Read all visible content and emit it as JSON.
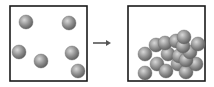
{
  "diagram": {
    "colors": {
      "box_stroke": "#1a1a1a",
      "arrow": "#555555",
      "sphere_light": "#d8d8d8",
      "sphere_mid": "#8f8f8f",
      "sphere_dark": "#5a5a5a"
    },
    "left_box": {
      "label": "",
      "x": 10,
      "y": 6,
      "w": 77,
      "h": 75,
      "particles": [
        {
          "cx": 26,
          "cy": 22
        },
        {
          "cx": 69,
          "cy": 23
        },
        {
          "cx": 19,
          "cy": 52
        },
        {
          "cx": 41,
          "cy": 61
        },
        {
          "cx": 72,
          "cy": 53
        },
        {
          "cx": 78,
          "cy": 71
        }
      ]
    },
    "arrow": {
      "x1": 93,
      "y1": 43,
      "x2": 111,
      "y2": 43,
      "direction": "right"
    },
    "right_box": {
      "label": "",
      "x": 128,
      "y": 6,
      "w": 77,
      "h": 75,
      "particles": [
        {
          "cx": 145,
          "cy": 73
        },
        {
          "cx": 157,
          "cy": 64
        },
        {
          "cx": 156,
          "cy": 45
        },
        {
          "cx": 145,
          "cy": 54
        },
        {
          "cx": 166,
          "cy": 71
        },
        {
          "cx": 178,
          "cy": 64
        },
        {
          "cx": 186,
          "cy": 72
        },
        {
          "cx": 196,
          "cy": 64
        },
        {
          "cx": 168,
          "cy": 54
        },
        {
          "cx": 179,
          "cy": 56
        },
        {
          "cx": 186,
          "cy": 60
        },
        {
          "cx": 190,
          "cy": 52
        },
        {
          "cx": 165,
          "cy": 43
        },
        {
          "cx": 176,
          "cy": 41
        },
        {
          "cx": 183,
          "cy": 46
        },
        {
          "cx": 198,
          "cy": 44
        },
        {
          "cx": 184,
          "cy": 37
        }
      ]
    },
    "particle_radius": 7
  }
}
